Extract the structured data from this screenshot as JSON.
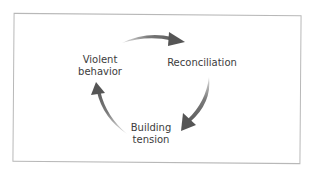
{
  "diagram": {
    "type": "cycle",
    "direction": "clockwise",
    "colors": {
      "arrow": "#555555",
      "arrow_tail": "#e6e6e6",
      "text": "#3c3c3c",
      "frame_border": "#b8b8b8",
      "background": "#ffffff"
    },
    "nodes": [
      {
        "id": "violent-behavior",
        "lines": [
          "Violent",
          "behavior"
        ]
      },
      {
        "id": "reconciliation",
        "lines": [
          "Reconciliation"
        ]
      },
      {
        "id": "building-tension",
        "lines": [
          "Building",
          "tension"
        ]
      }
    ],
    "edges": [
      {
        "from": "violent-behavior",
        "to": "reconciliation",
        "icon": "curved-arrow-right"
      },
      {
        "from": "reconciliation",
        "to": "building-tension",
        "icon": "curved-arrow-down-left"
      },
      {
        "from": "building-tension",
        "to": "violent-behavior",
        "icon": "curved-arrow-up"
      }
    ]
  }
}
